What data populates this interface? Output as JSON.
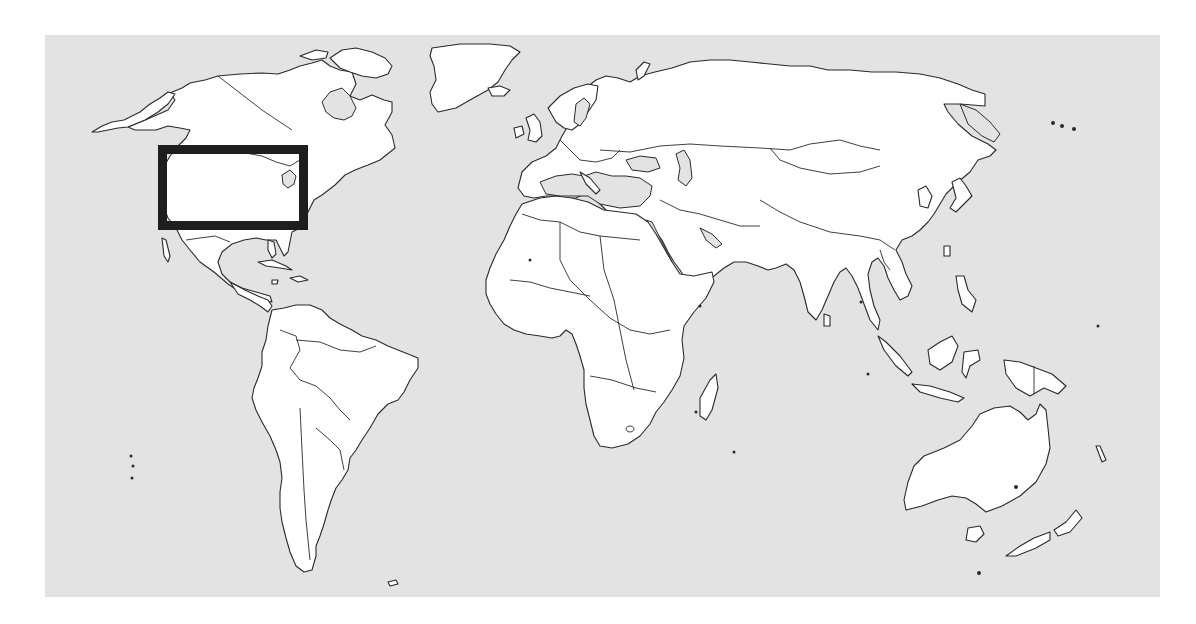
{
  "figure": {
    "type": "world-political-outline-map",
    "projection_description": "Equirectangular-style world map, Pacific cut at left, no Antarctica",
    "colors": {
      "ocean": "#e3e3e3",
      "land": "#ffffff",
      "coastline": "#2a2a2a",
      "highlight_box": "#1e1e1e",
      "page_background": "#ffffff"
    },
    "map_extent_px": {
      "left": 45,
      "top": 35,
      "right": 1160,
      "bottom": 597
    },
    "highlight": {
      "label": "Study region: continental United States",
      "region": "continental-united-states",
      "box_px": {
        "x": 158,
        "y": 145,
        "width": 150,
        "height": 85
      },
      "stroke_width_px": 9
    },
    "continents": [
      "North America",
      "Greenland",
      "South America",
      "Europe",
      "Africa",
      "Asia",
      "Australia",
      "New Zealand"
    ]
  }
}
